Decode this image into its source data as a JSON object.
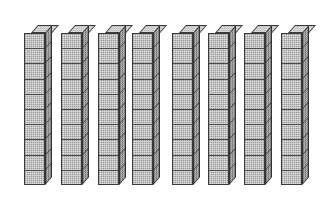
{
  "figure": {
    "kind": "base-ten-blocks",
    "caption": "",
    "background_color": "#ffffff",
    "canvas": {
      "width": 325,
      "height": 199
    },
    "totals": {
      "rod_count": 8,
      "units_per_rod": 10,
      "total_units": 80
    },
    "style": {
      "front_face_color": "#9a9a9a",
      "side_face_color": "#6f6f6f",
      "top_face_color": "#b4b4b4",
      "edge_color": "#3a3a3a",
      "texture": "dithered-halftone"
    },
    "geometry": {
      "rod_width": 21,
      "rod_height": 152,
      "depth_x": 7,
      "depth_y": 8,
      "top_y": 25
    },
    "rods": [
      {
        "id": "rod-1",
        "label": "ten-rod-1",
        "units": 10,
        "value": 10,
        "left": 24,
        "top": 25
      },
      {
        "id": "rod-2",
        "label": "ten-rod-2",
        "units": 10,
        "value": 10,
        "left": 61,
        "top": 25
      },
      {
        "id": "rod-3",
        "label": "ten-rod-3",
        "units": 10,
        "value": 10,
        "left": 98,
        "top": 25
      },
      {
        "id": "rod-4",
        "label": "ten-rod-4",
        "units": 10,
        "value": 10,
        "left": 132,
        "top": 25
      },
      {
        "id": "rod-5",
        "label": "ten-rod-5",
        "units": 10,
        "value": 10,
        "left": 172,
        "top": 25
      },
      {
        "id": "rod-6",
        "label": "ten-rod-6",
        "units": 10,
        "value": 10,
        "left": 208,
        "top": 25
      },
      {
        "id": "rod-7",
        "label": "ten-rod-7",
        "units": 10,
        "value": 10,
        "left": 244,
        "top": 25
      },
      {
        "id": "rod-8",
        "label": "ten-rod-8",
        "units": 10,
        "value": 10,
        "left": 281,
        "top": 25
      }
    ]
  }
}
